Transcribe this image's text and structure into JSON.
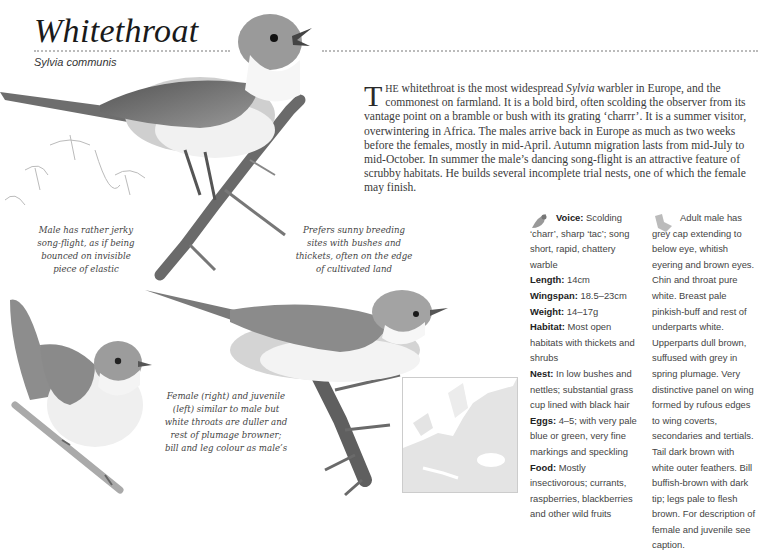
{
  "header": {
    "title": "Whitethroat",
    "latin_name": "Sylvia communis"
  },
  "intro": {
    "drop_cap": "T",
    "lead_smallcaps": "HE",
    "text_before_italic": " whitethroat is the most widespread ",
    "italic_word": "Sylvia",
    "text_after_italic": " warbler in Europe, and the commonest on farmland. It is a bold bird, often scolding the observer from its vantage point on a bramble or bush with its grating ‘charrr’. It is a summer visitor, overwintering in Africa. The males arrive back in Europe as much as two weeks before the females, mostly in mid-April. Autumn migration lasts from mid-July to mid-October. In summer the male’s dancing song-flight is an attractive feature of scrubby habitats. He builds several incomplete trial nests, one of which the female may finish."
  },
  "captions": {
    "song_flight": "Male has rather jerky song-flight, as if being bounced on invisible piece of elastic",
    "habitat": "Prefers sunny breeding sites with bushes and thickets, often on the edge of cultivated land",
    "female_juvenile": "Female (right) and juvenile (left) similar to male but white throats are duller and rest of plumage browner; bill and leg colour as male’s"
  },
  "facts": [
    {
      "label": "Voice:",
      "value": " Scolding ‘charr’, sharp ‘tac’; song short, rapid, chattery warble"
    },
    {
      "label": "Length:",
      "value": " 14cm"
    },
    {
      "label": "Wingspan:",
      "value": " 18.5–23cm"
    },
    {
      "label": "Weight:",
      "value": " 14–17g"
    },
    {
      "label": "Habitat:",
      "value": " Most open habitats with thickets and shrubs"
    },
    {
      "label": "Nest:",
      "value": " In low bushes and nettles; substantial grass cup lined with black hair"
    },
    {
      "label": "Eggs:",
      "value": " 4–5; with very pale blue or green, very fine markings and speckling"
    },
    {
      "label": "Food:",
      "value": " Mostly insectivorous; currants, raspberries, blackberries and other wild fruits"
    }
  ],
  "description": "Adult male has grey cap extending to below eye, whitish eyering and brown eyes. Chin and throat pure white. Breast pale pinkish-buff and rest of underparts white. Upperparts dull brown, suffused with grey in spring plumage. Very distinctive panel on wing formed by rufous edges to wing coverts, secondaries and tertials. Tail dark brown with white outer feathers. Bill buffish-brown with dark tip; legs pale to flesh brown. For description of female and juvenile see caption.",
  "icons": {
    "facts_icon": "bird-silhouette-icon",
    "description_icon": "bird-plumage-icon"
  },
  "colors": {
    "text": "#333333",
    "illustration_grey": "#8a8a8a",
    "map_range": "#e2e2e2"
  }
}
